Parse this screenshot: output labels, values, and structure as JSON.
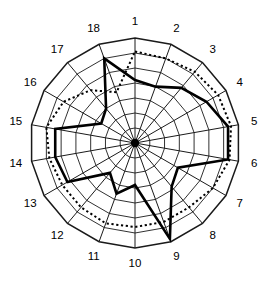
{
  "chart_data": {
    "type": "radar",
    "title": "",
    "subtitle": "",
    "xlabel": "",
    "ylabel": "",
    "grid": true,
    "legend": "none",
    "axis_count": 18,
    "ring_count": 7,
    "rlim": [
      0,
      7
    ],
    "categories": [
      "1",
      "2",
      "3",
      "4",
      "5",
      "6",
      "7",
      "8",
      "9",
      "10",
      "11",
      "12",
      "13",
      "14",
      "15",
      "16",
      "17",
      "18"
    ],
    "tick_labels": [
      "1",
      "2",
      "3",
      "4",
      "5",
      "6",
      "7",
      "8",
      "9",
      "10",
      "11",
      "12",
      "13",
      "14",
      "15",
      "16",
      "17",
      "18"
    ],
    "series": [
      {
        "name": "solid",
        "style": "solid-bold",
        "color": "#000000",
        "values": [
          4.2,
          4.0,
          4.8,
          5.5,
          6.3,
          6.3,
          3.3,
          3.8,
          6.8,
          2.8,
          3.6,
          2.6,
          5.2,
          5.4,
          5.4,
          2.6,
          3.0,
          6.0
        ]
      },
      {
        "name": "dotted",
        "style": "dotted",
        "color": "#000000",
        "values": [
          6.1,
          6.0,
          6.2,
          6.4,
          6.5,
          6.4,
          6.0,
          5.6,
          5.6,
          5.6,
          5.7,
          5.6,
          5.6,
          5.8,
          6.0,
          5.5,
          4.6,
          3.6
        ]
      }
    ],
    "geometry": {
      "cx": 135,
      "cy": 143,
      "outer_radius": 105,
      "label_radius": 121,
      "start_angle_deg": -90,
      "direction": "clockwise"
    },
    "colors": {
      "grid": "#1a1a1a",
      "spoke": "#1a1a1a",
      "series_solid": "#000000",
      "series_dotted": "#000000",
      "background": "#ffffff",
      "label": "#000000"
    }
  }
}
